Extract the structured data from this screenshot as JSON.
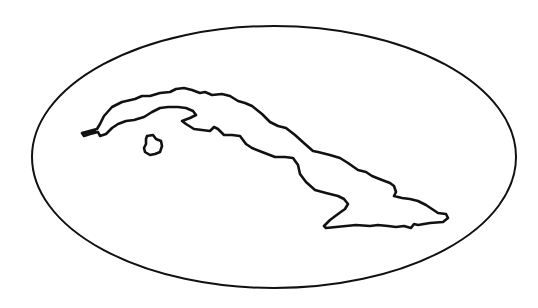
{
  "map": {
    "subject": "Cuba outline",
    "style": "black line drawing on white",
    "colors": {
      "background": "#ffffff",
      "stroke": "#111111"
    },
    "frame": {
      "shape": "ellipse",
      "cx": 274,
      "cy": 157,
      "rx": 242,
      "ry": 132
    },
    "features": [
      {
        "name": "Main island of Cuba"
      },
      {
        "name": "Isla de la Juventud"
      }
    ]
  }
}
